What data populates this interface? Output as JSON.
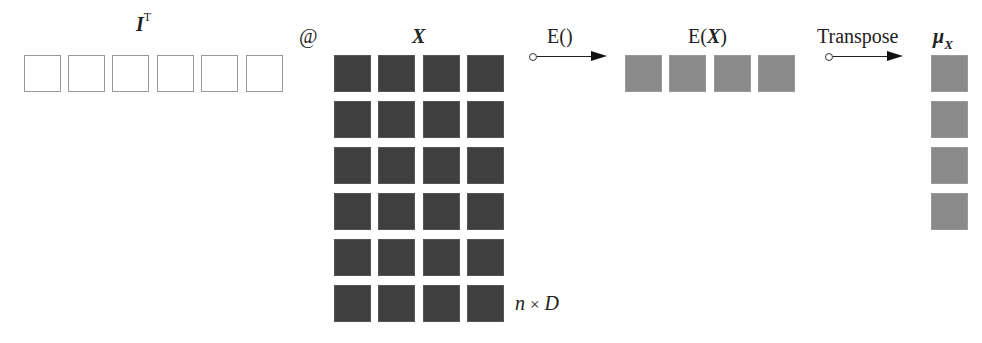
{
  "diagram": {
    "ones_vector": {
      "label_symbol": "I",
      "label_superscript": "T",
      "cells": 6,
      "style": "empty"
    },
    "operator": "@",
    "matrix_x": {
      "label": "X",
      "rows": 6,
      "cols": 4,
      "dimension_label_n": "n",
      "dimension_label_times": "×",
      "dimension_label_d": "D",
      "style": "dark"
    },
    "arrow_expectation": {
      "label": "E()"
    },
    "expectation_result": {
      "label_prefix": "E(",
      "label_symbol": "X",
      "label_suffix": ")",
      "cells": 4,
      "style": "mid"
    },
    "arrow_transpose": {
      "label": "Transpose"
    },
    "mean_vector": {
      "label_symbol": "μ",
      "label_subscript": "X",
      "cells": 4,
      "style": "mid"
    },
    "colors": {
      "empty_border": "#9a9a9a",
      "dark_fill": "#3f3f3f",
      "mid_fill": "#8a8a8a",
      "arrow": "#111111"
    }
  }
}
